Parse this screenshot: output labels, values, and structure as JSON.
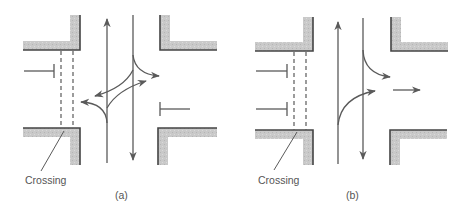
{
  "figure": {
    "colors": {
      "curb_fill": "#c8c8c8",
      "curb_edge": "#555555",
      "line": "#5a5a5a",
      "text": "#555555",
      "background": "#ffffff"
    },
    "panels": [
      {
        "id": "a",
        "caption": "(a)",
        "crossing_label": "Crossing",
        "description": "Intersection with pedestrian crossing on west approach; two-way vertical road with left/right turning movements; stop bars on west and east approaches"
      },
      {
        "id": "b",
        "caption": "(b)",
        "crossing_label": "Crossing",
        "description": "Intersection with pedestrian crossing on west approach; two-way vertical road with right turn out to east; two stop bars on west approach"
      }
    ]
  }
}
